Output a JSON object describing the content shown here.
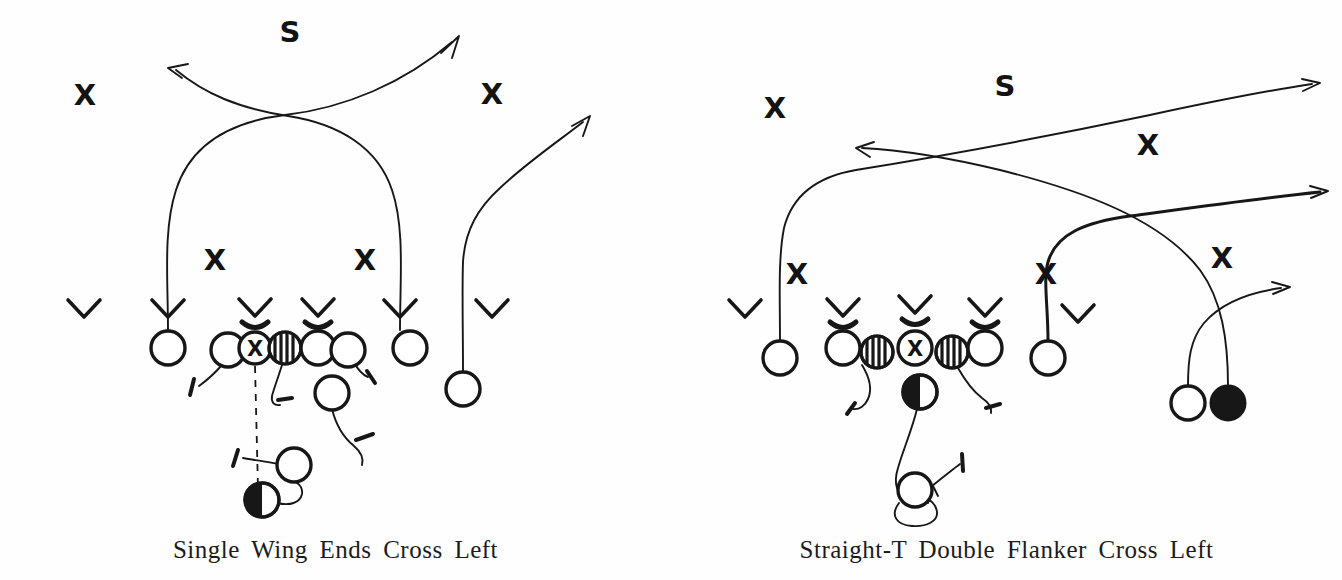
{
  "page": {
    "background_color": "#fefefe",
    "ink_color": "#171717",
    "width": 1342,
    "height": 580
  },
  "diagrams": [
    {
      "id": "left",
      "caption": "Single Wing Ends Cross Left",
      "formation": "Single Wing",
      "defense_markers": [
        {
          "label": "X",
          "x": 85,
          "y": 105
        },
        {
          "label": "S",
          "x": 290,
          "y": 42
        },
        {
          "label": "X",
          "x": 492,
          "y": 104
        },
        {
          "label": "X",
          "x": 215,
          "y": 270
        },
        {
          "label": "X",
          "x": 365,
          "y": 270
        }
      ],
      "defense_line": [
        {
          "x": 84,
          "y": 305,
          "bowl": false
        },
        {
          "x": 168,
          "y": 305,
          "bowl": false
        },
        {
          "x": 255,
          "y": 305,
          "bowl": true
        },
        {
          "x": 318,
          "y": 305,
          "bowl": true
        },
        {
          "x": 400,
          "y": 305,
          "bowl": false
        },
        {
          "x": 492,
          "y": 305,
          "bowl": false
        }
      ],
      "offense_players": [
        {
          "name": "left-end",
          "type": "open",
          "x": 168,
          "y": 348
        },
        {
          "name": "left-tackle",
          "type": "open",
          "x": 228,
          "y": 350
        },
        {
          "name": "center",
          "type": "xmark",
          "x": 255,
          "y": 348
        },
        {
          "name": "right-guard",
          "type": "striped",
          "x": 285,
          "y": 348
        },
        {
          "name": "right-tackle",
          "type": "open",
          "x": 318,
          "y": 348
        },
        {
          "name": "right-end-in",
          "type": "open",
          "x": 348,
          "y": 350
        },
        {
          "name": "right-end-out",
          "type": "open",
          "x": 410,
          "y": 348
        },
        {
          "name": "wingback",
          "type": "open",
          "x": 463,
          "y": 389
        },
        {
          "name": "blocking-back",
          "type": "open",
          "x": 332,
          "y": 393
        },
        {
          "name": "tailback",
          "type": "open",
          "x": 294,
          "y": 465
        },
        {
          "name": "fullback",
          "type": "half",
          "x": 262,
          "y": 500
        }
      ],
      "routes": [
        {
          "name": "left-end-cross-right",
          "arrow": true
        },
        {
          "name": "right-end-cross-left",
          "arrow": true
        },
        {
          "name": "wingback-up",
          "arrow": true
        },
        {
          "name": "snap-line",
          "arrow": false
        }
      ]
    },
    {
      "id": "right",
      "caption": "Straight-T Double Flanker Cross Left",
      "formation": "Straight-T Double Flanker",
      "defense_markers": [
        {
          "label": "X",
          "x": 775,
          "y": 118
        },
        {
          "label": "S",
          "x": 1005,
          "y": 96
        },
        {
          "label": "X",
          "x": 1148,
          "y": 155
        },
        {
          "label": "X",
          "x": 797,
          "y": 284
        },
        {
          "label": "X",
          "x": 1046,
          "y": 284
        },
        {
          "label": "X",
          "x": 1222,
          "y": 268
        }
      ],
      "defense_line": [
        {
          "x": 745,
          "y": 305,
          "bowl": false
        },
        {
          "x": 843,
          "y": 305,
          "bowl": true
        },
        {
          "x": 915,
          "y": 302,
          "bowl": true
        },
        {
          "x": 985,
          "y": 305,
          "bowl": true
        },
        {
          "x": 1078,
          "y": 310,
          "bowl": false
        }
      ],
      "offense_players": [
        {
          "name": "left-end",
          "type": "open",
          "x": 780,
          "y": 358
        },
        {
          "name": "left-tackle",
          "type": "open",
          "x": 843,
          "y": 348
        },
        {
          "name": "left-guard",
          "type": "striped",
          "x": 877,
          "y": 352
        },
        {
          "name": "center",
          "type": "xmark",
          "x": 915,
          "y": 348
        },
        {
          "name": "right-guard",
          "type": "striped",
          "x": 952,
          "y": 352
        },
        {
          "name": "right-tackle",
          "type": "open",
          "x": 985,
          "y": 348
        },
        {
          "name": "right-end",
          "type": "open",
          "x": 1048,
          "y": 358
        },
        {
          "name": "quarterback",
          "type": "half",
          "x": 920,
          "y": 392
        },
        {
          "name": "fullback",
          "type": "open",
          "x": 915,
          "y": 490
        },
        {
          "name": "flanker-inside",
          "type": "open",
          "x": 1188,
          "y": 403
        },
        {
          "name": "flanker-outside",
          "type": "solid",
          "x": 1228,
          "y": 403
        }
      ],
      "routes": [
        {
          "name": "left-end-cross-right",
          "arrow": true
        },
        {
          "name": "right-end-cross-left",
          "arrow": true
        },
        {
          "name": "flanker-inside-out",
          "arrow": true
        },
        {
          "name": "flanker-outside-in",
          "arrow": true
        }
      ]
    }
  ]
}
